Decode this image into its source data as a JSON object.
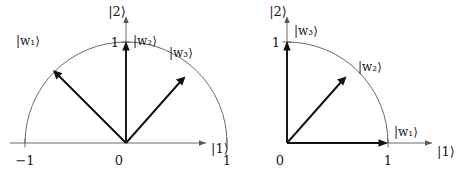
{
  "figure": {
    "title": "",
    "panels": [
      {
        "id": "left-panel",
        "name": "semicircle-basis-diagram",
        "origin_label": "0",
        "x_axis": {
          "label": "|1⟩",
          "ticks": [
            {
              "value": -1,
              "label": "−1"
            },
            {
              "value": 0,
              "label": "0"
            },
            {
              "value": 1,
              "label": "1"
            }
          ],
          "range": [
            -1.25,
            1.25
          ]
        },
        "y_axis": {
          "label": "|2⟩",
          "ticks": [
            {
              "value": 1,
              "label": "1"
            }
          ],
          "range": [
            0,
            1.3
          ]
        },
        "arc": {
          "radius": 1,
          "start_angle_deg": 0,
          "end_angle_deg": 180
        },
        "vectors": [
          {
            "label": "|w₁⟩",
            "angle_deg": 135,
            "length": 1
          },
          {
            "label": "|w₂⟩",
            "angle_deg": 90,
            "length": 1
          },
          {
            "label": "|w₃⟩",
            "angle_deg": 45,
            "length": 1
          }
        ]
      },
      {
        "id": "right-panel",
        "name": "quarter-circle-basis-diagram",
        "origin_label": "0",
        "x_axis": {
          "label": "|1⟩",
          "ticks": [
            {
              "value": 0,
              "label": "0"
            },
            {
              "value": 1,
              "label": "1"
            }
          ],
          "range": [
            0,
            1.25
          ]
        },
        "y_axis": {
          "label": "|2⟩",
          "ticks": [
            {
              "value": 1,
              "label": "1"
            }
          ],
          "range": [
            0,
            1.3
          ]
        },
        "arc": {
          "radius": 1,
          "start_angle_deg": 0,
          "end_angle_deg": 90
        },
        "vectors": [
          {
            "label": "|w₁⟩",
            "angle_deg": 0,
            "length": 1
          },
          {
            "label": "|w₂⟩",
            "angle_deg": 45,
            "length": 1
          },
          {
            "label": "|w₃⟩",
            "angle_deg": 90,
            "length": 1
          }
        ]
      }
    ]
  },
  "colors": {
    "background": "#ffffff",
    "axis": "#5a5a5a",
    "vector": "#111111",
    "text": "#1a1a1a"
  }
}
